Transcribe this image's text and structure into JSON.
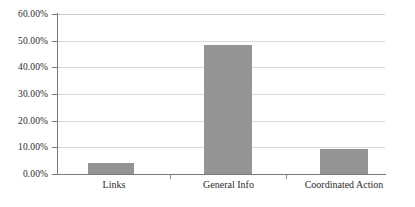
{
  "chart_data": {
    "type": "bar",
    "title": "",
    "subtitle": "",
    "xlabel": "",
    "ylabel": "",
    "categories": [
      "Links",
      "General Info",
      "Coordinated Action"
    ],
    "values": [
      4.1,
      48.4,
      9.2
    ],
    "value_format": "percent",
    "ylim": [
      0,
      60
    ],
    "ytick_step": 10,
    "ytick_labels": [
      "0.00%",
      "10.00%",
      "20.00%",
      "30.00%",
      "40.00%",
      "50.00%",
      "60.00%"
    ],
    "ytick_values": [
      0,
      10,
      20,
      30,
      40,
      50,
      60
    ],
    "grid": "horizontal",
    "legend": "none",
    "series": [
      {
        "name": "",
        "values": [
          4.1,
          48.4,
          9.2
        ]
      }
    ],
    "colors": {
      "bar_fill": "#949494",
      "gridline": "#d9d9d9",
      "axis": "#7a7a7a",
      "text": "#2b2b2b",
      "background": "#ffffff"
    }
  }
}
